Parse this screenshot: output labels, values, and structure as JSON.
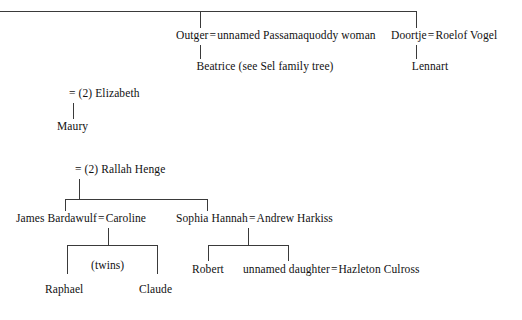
{
  "diagram": {
    "title": "Family tree",
    "line_color": "#3a3a3a"
  },
  "generation_1": {
    "couple_outger": {
      "person": "Outger",
      "equals": "=",
      "spouse": "unnamed Passamaquoddy woman",
      "full": "Outger = unnamed Passamaquoddy woman"
    },
    "couple_doortje": {
      "person": "Doortje",
      "equals": "=",
      "spouse": "Roelof Vogel",
      "full": "Doortje = Roelof Vogel"
    }
  },
  "generation_2": {
    "beatrice": "Beatrice (see Sel family tree)",
    "lennart": "Lennart"
  },
  "branch_elizabeth": {
    "marriage": "= (2) Elizabeth",
    "child": "Maury"
  },
  "branch_rallah": {
    "marriage": "= (2) Rallah Henge",
    "couple_james": {
      "person": "James Bardawulf",
      "equals": "=",
      "spouse": "Caroline",
      "full": "James Bardawulf = Caroline"
    },
    "couple_sophia": {
      "person": "Sophia Hannah",
      "equals": "=",
      "spouse": "Andrew Harkiss",
      "full": "Sophia Hannah = Andrew Harkiss"
    }
  },
  "children_james": {
    "note": "(twins)",
    "left": "Raphael",
    "right": "Claude"
  },
  "children_sophia": {
    "left": "Robert",
    "right_couple": {
      "person": "unnamed daughter",
      "equals": "=",
      "spouse": "Hazleton Culross",
      "full": "unnamed daughter = Hazleton Culross"
    }
  }
}
